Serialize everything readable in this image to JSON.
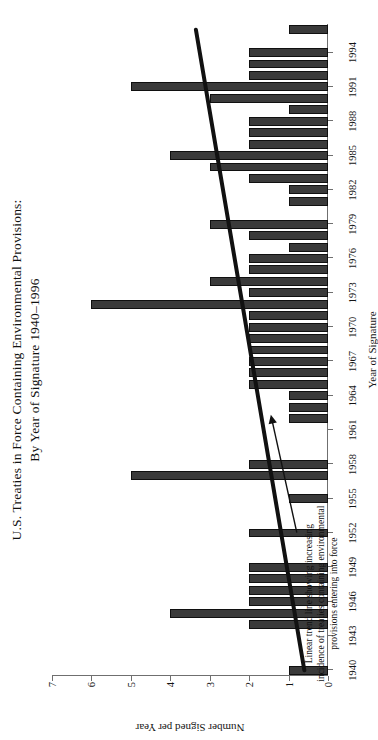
{
  "chart_data": {
    "type": "bar",
    "orientation": "vertical",
    "title": "U.S. Treaties in Force Containing Environmental Provisions:",
    "title_line2": "By Year of Signature 1940–1996",
    "xlabel": "Year of Signature",
    "ylabel": "Number Signed per Year",
    "ylim": [
      0,
      7
    ],
    "yticks": [
      0,
      1,
      2,
      3,
      4,
      5,
      6,
      7
    ],
    "xtick_labels": [
      "1940",
      "1943",
      "1946",
      "1949",
      "1952",
      "1955",
      "1958",
      "1961",
      "1964",
      "1967",
      "1970",
      "1973",
      "1976",
      "1979",
      "1982",
      "1985",
      "1988",
      "1991",
      "1994"
    ],
    "grid": false,
    "legend": null,
    "bar_color": "#3a3a3a",
    "bar_edge_color": "#101010",
    "trendline": {
      "label": "Linear trend line showing increasing incidence of treaties containing environmental provisions entering into force",
      "color": "#111111",
      "x_start": 1940,
      "y_start": 0.6,
      "x_end": 1996,
      "y_end": 3.35
    },
    "annotation": {
      "line1": "Linear trend line showing increasing",
      "line2": "incidence of treaties containing environmental",
      "line3": "provisions entering into force",
      "arrow": "arrow-pointing-right"
    },
    "categories": [
      1940,
      1941,
      1942,
      1943,
      1944,
      1945,
      1946,
      1947,
      1948,
      1949,
      1950,
      1951,
      1952,
      1953,
      1954,
      1955,
      1956,
      1957,
      1958,
      1959,
      1960,
      1961,
      1962,
      1963,
      1964,
      1965,
      1966,
      1967,
      1968,
      1969,
      1970,
      1971,
      1972,
      1973,
      1974,
      1975,
      1976,
      1977,
      1978,
      1979,
      1980,
      1981,
      1982,
      1983,
      1984,
      1985,
      1986,
      1987,
      1988,
      1989,
      1990,
      1991,
      1992,
      1993,
      1994,
      1995,
      1996
    ],
    "values": [
      1,
      0,
      0,
      0,
      2,
      4,
      2,
      2,
      2,
      2,
      0,
      0,
      2,
      0,
      0,
      1,
      0,
      5,
      2,
      0,
      0,
      0,
      1,
      1,
      1,
      2,
      2,
      2,
      2,
      2,
      2,
      2,
      6,
      2,
      3,
      2,
      2,
      1,
      2,
      3,
      0,
      1,
      1,
      2,
      3,
      4,
      2,
      2,
      2,
      1,
      3,
      5,
      2,
      2,
      2,
      0,
      1
    ]
  }
}
